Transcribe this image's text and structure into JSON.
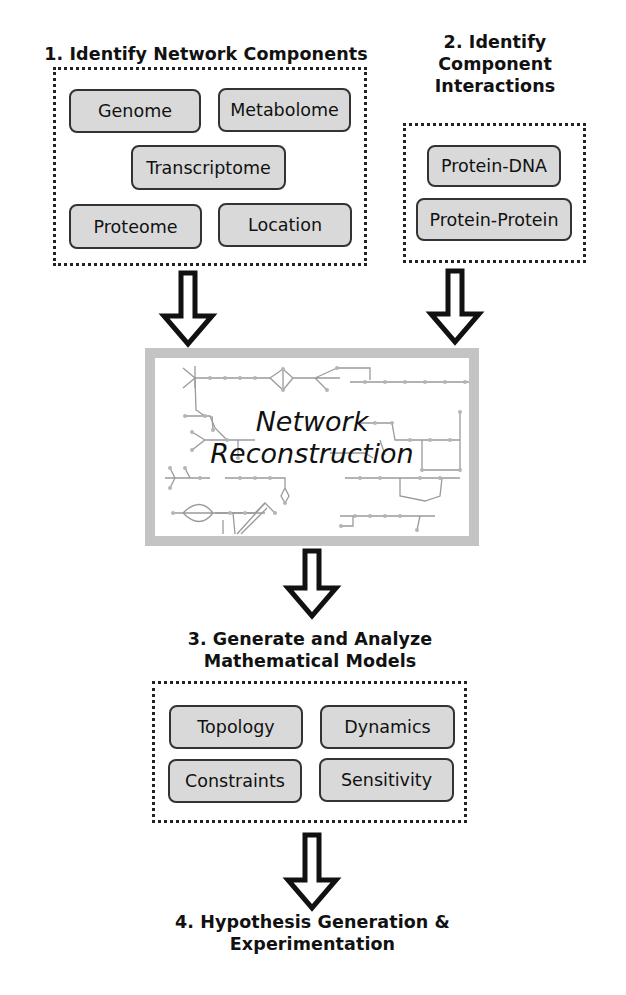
{
  "step1": {
    "title": "1. Identify Network Components",
    "items": [
      "Genome",
      "Metabolome",
      "Transcriptome",
      "Proteome",
      "Location"
    ]
  },
  "step2": {
    "title_lines": [
      "2. Identify",
      "Component",
      "Interactions"
    ],
    "items": [
      "Protein-DNA",
      "Protein-Protein"
    ]
  },
  "network": {
    "label_lines": [
      "Network",
      "Reconstruction"
    ]
  },
  "step3": {
    "title_lines": [
      "3. Generate and Analyze",
      "Mathematical Models"
    ],
    "items": [
      "Topology",
      "Dynamics",
      "Constraints",
      "Sensitivity"
    ]
  },
  "step4": {
    "title_lines": [
      "4. Hypothesis Generation &",
      "Experimentation"
    ]
  },
  "colors": {
    "pill_fill": "#d9d9d9",
    "network_border": "#c4c4c4",
    "network_lines": "#9a9a9a",
    "text": "#111111"
  }
}
